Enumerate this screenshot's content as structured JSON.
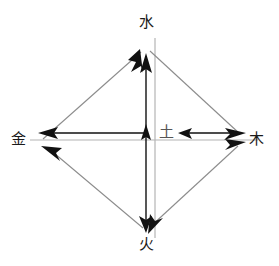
{
  "diagram": {
    "canvas": {
      "width": 279,
      "height": 266,
      "background": "#ffffff"
    },
    "colors": {
      "arrow_dark": "#111111",
      "guide_gray": "#b4b4b4",
      "diagonal_gray": "#8c8c8c",
      "label_dark": "#1a1a1a",
      "label_gray": "#555555"
    },
    "nodes": [
      {
        "id": "water",
        "label": "水",
        "position": "top",
        "x": 146,
        "y": 23,
        "color": "#1a1a1a"
      },
      {
        "id": "metal",
        "label": "金",
        "position": "left",
        "x": 18,
        "y": 140,
        "color": "#1a1a1a"
      },
      {
        "id": "earth",
        "label": "土",
        "position": "center",
        "x": 166,
        "y": 133,
        "color": "#555555"
      },
      {
        "id": "wood",
        "label": "木",
        "position": "right",
        "x": 256,
        "y": 140,
        "color": "#1a1a1a"
      },
      {
        "id": "fire",
        "label": "火",
        "position": "bottom",
        "x": 146,
        "y": 245,
        "color": "#1a1a1a"
      }
    ],
    "vertices": {
      "top": {
        "x": 146,
        "y": 47
      },
      "left": {
        "x": 42,
        "y": 140
      },
      "right": {
        "x": 243,
        "y": 140
      },
      "bottom": {
        "x": 146,
        "y": 231
      },
      "center": {
        "x": 146,
        "y": 140
      }
    },
    "guides": [
      {
        "id": "guide-horizontal",
        "type": "line",
        "from": [
          30,
          140
        ],
        "to": [
          258,
          140
        ],
        "color": "#b4b4b4"
      },
      {
        "id": "guide-vertical",
        "type": "line",
        "from": [
          155,
          38
        ],
        "to": [
          155,
          238
        ],
        "color": "#b4b4b4"
      }
    ],
    "edges": [
      {
        "id": "edge-metal-to-water",
        "from": "metal",
        "to": "water",
        "style": "diagonal",
        "color": "#8c8c8c",
        "arrow_at": "water"
      },
      {
        "id": "edge-water-to-wood",
        "from": "water",
        "to": "wood",
        "style": "diagonal",
        "color": "#8c8c8c",
        "arrow_at": "wood"
      },
      {
        "id": "edge-fire-to-metal",
        "from": "fire",
        "to": "metal",
        "style": "diagonal",
        "color": "#8c8c8c",
        "arrow_at": "metal"
      },
      {
        "id": "edge-wood-fire-double",
        "from": "wood",
        "to": "fire",
        "style": "diagonal",
        "color": "#8c8c8c",
        "arrow_at": "both"
      },
      {
        "id": "edge-earth-to-metal",
        "from": "earth",
        "to": "metal",
        "style": "axis-horizontal",
        "color": "#111111",
        "arrow_at": "metal"
      },
      {
        "id": "edge-wood-to-earth",
        "from": "wood",
        "to": "earth",
        "style": "axis-horizontal",
        "color": "#111111",
        "arrow_at": "earth"
      },
      {
        "id": "edge-earth-to-water",
        "from": "earth",
        "to": "water",
        "style": "axis-vertical",
        "color": "#111111",
        "arrow_at": "water"
      },
      {
        "id": "edge-earth-to-fire",
        "from": "earth",
        "to": "fire",
        "style": "axis-vertical",
        "color": "#111111",
        "arrow_at": "fire"
      },
      {
        "id": "edge-center-up-mark",
        "from": "center",
        "to": "center",
        "style": "axis-vertical",
        "color": "#111111",
        "arrow_at": "center-up"
      }
    ]
  }
}
